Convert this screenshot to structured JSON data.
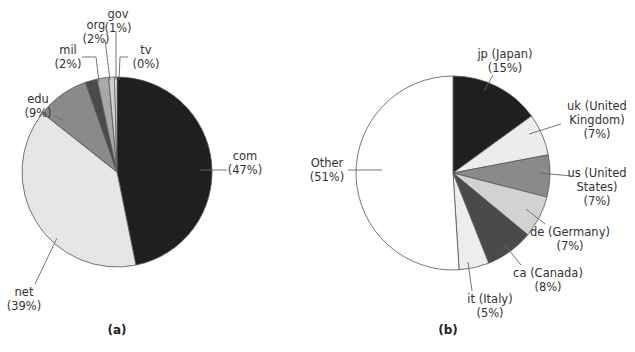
{
  "chart_data": [
    {
      "type": "pie",
      "caption": "(a)",
      "title": "",
      "start_angle": "12 o'clock",
      "direction": "clockwise",
      "slices": [
        {
          "label": "com",
          "pct_label": "(47%)",
          "value": 47,
          "color": "#1f1f1f"
        },
        {
          "label": "net",
          "pct_label": "(39%)",
          "value": 39,
          "color": "#e6e6e6"
        },
        {
          "label": "edu",
          "pct_label": "(9%)",
          "value": 9,
          "color": "#8a8a8a"
        },
        {
          "label": "mil",
          "pct_label": "(2%)",
          "value": 2,
          "color": "#4a4a4a"
        },
        {
          "label": "org",
          "pct_label": "(2%)",
          "value": 2,
          "color": "#a8a8a8"
        },
        {
          "label": "gov",
          "pct_label": "(1%)",
          "value": 1,
          "color": "#d0d0d0"
        },
        {
          "label": "tv",
          "pct_label": "(0%)",
          "value": 0.4,
          "color": "#ffffff"
        }
      ],
      "layout": {
        "cx": 117,
        "cy": 172,
        "r": 95
      },
      "labels": [
        {
          "lines": [
            "com",
            "(47%)"
          ],
          "x": 245,
          "y": 160,
          "anchor": "middle",
          "leader": [
            [
              200,
              170
            ],
            [
              227,
              170
            ]
          ]
        },
        {
          "lines": [
            "net",
            "(39%)"
          ],
          "x": 24,
          "y": 296,
          "anchor": "middle",
          "leader": [
            [
              35,
              284
            ],
            [
              57,
              238
            ]
          ]
        },
        {
          "lines": [
            "edu",
            "(9%)"
          ],
          "x": 38,
          "y": 103,
          "anchor": "middle",
          "leader": [
            [
              55,
              116
            ],
            [
              63,
              120
            ]
          ]
        },
        {
          "lines": [
            "mil",
            "(2%)"
          ],
          "x": 68,
          "y": 54,
          "anchor": "middle",
          "leader": [
            [
              82,
              57
            ],
            [
              96,
              57
            ],
            [
              99,
              82
            ]
          ]
        },
        {
          "lines": [
            "org",
            "(2%)"
          ],
          "x": 96,
          "y": 29,
          "anchor": "middle",
          "leader": [
            [
              105,
              40
            ],
            [
              110,
              80
            ]
          ]
        },
        {
          "lines": [
            "gov",
            "(1%)"
          ],
          "x": 118,
          "y": 18,
          "anchor": "middle",
          "leader": [
            [
              116,
              31
            ],
            [
              116,
              80
            ]
          ]
        },
        {
          "lines": [
            "tv",
            "(0%)"
          ],
          "x": 146,
          "y": 54,
          "anchor": "middle",
          "leader": [
            [
              128,
              57
            ],
            [
              120,
              57
            ],
            [
              119,
              80
            ]
          ]
        }
      ]
    },
    {
      "type": "pie",
      "caption": "(b)",
      "title": "",
      "start_angle": "12 o'clock",
      "direction": "clockwise",
      "slices": [
        {
          "label": "jp (Japan)",
          "pct_label": "(15%)",
          "value": 15,
          "color": "#1f1f1f"
        },
        {
          "label": "uk (United Kingdom)",
          "pct_label": "(7%)",
          "value": 7,
          "color": "#ececec"
        },
        {
          "label": "us (United States)",
          "pct_label": "(7%)",
          "value": 7,
          "color": "#8a8a8a"
        },
        {
          "label": "de (Germany)",
          "pct_label": "(7%)",
          "value": 7,
          "color": "#d2d2d2"
        },
        {
          "label": "ca (Canada)",
          "pct_label": "(8%)",
          "value": 8,
          "color": "#4a4a4a"
        },
        {
          "label": "it (Italy)",
          "pct_label": "(5%)",
          "value": 5,
          "color": "#ededed"
        },
        {
          "label": "Other",
          "pct_label": "(51%)",
          "value": 51,
          "color": "#ffffff"
        }
      ],
      "layout": {
        "cx": 453,
        "cy": 173,
        "r": 97
      },
      "labels": [
        {
          "lines": [
            "jp (Japan)",
            "(15%)"
          ],
          "x": 505,
          "y": 58,
          "anchor": "middle",
          "leader": [
            [
              493,
              75
            ],
            [
              484,
              91
            ]
          ]
        },
        {
          "lines": [
            "uk (United",
            "Kingdom)",
            "(7%)"
          ],
          "x": 597,
          "y": 110,
          "anchor": "middle",
          "leader": [
            [
              561,
              124
            ],
            [
              529,
              134
            ]
          ]
        },
        {
          "lines": [
            "us (United",
            "States)",
            "(7%)"
          ],
          "x": 597,
          "y": 177,
          "anchor": "middle",
          "leader": [
            [
              571,
              176
            ],
            [
              540,
              173
            ]
          ]
        },
        {
          "lines": [
            "de (Germany)",
            "(7%)"
          ],
          "x": 570,
          "y": 236,
          "anchor": "middle",
          "leader": [
            [
              545,
              224
            ],
            [
              526,
              209
            ]
          ]
        },
        {
          "lines": [
            "ca (Canada)",
            "(8%)"
          ],
          "x": 548,
          "y": 277,
          "anchor": "middle",
          "leader": [
            [
              521,
              265
            ],
            [
              505,
              245
            ]
          ]
        },
        {
          "lines": [
            "it (Italy)",
            "(5%)"
          ],
          "x": 490,
          "y": 303,
          "anchor": "middle",
          "leader": [
            [
              472,
              291
            ],
            [
              468,
              262
            ]
          ]
        },
        {
          "lines": [
            "Other",
            "(51%)"
          ],
          "x": 327,
          "y": 167,
          "anchor": "middle",
          "leader": [
            [
              348,
              170
            ],
            [
              382,
              170
            ]
          ]
        }
      ]
    }
  ],
  "captions": {
    "a": "(a)",
    "b": "(b)"
  },
  "caption_positions": {
    "a": {
      "x": 117,
      "y": 334
    },
    "b": {
      "x": 448,
      "y": 334
    }
  }
}
